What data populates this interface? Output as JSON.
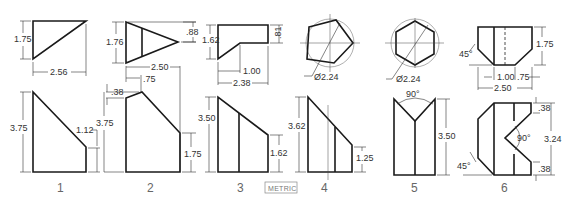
{
  "figure": {
    "badge": "METRIC",
    "problems": [
      {
        "number": "1",
        "top_view": {
          "height": "1.75",
          "width": "2.56"
        },
        "front_view": {
          "height": "3.75",
          "right_height": "1.12"
        }
      },
      {
        "number": "2",
        "top_view": {
          "height": "1.76",
          "tip_offset": ".88",
          "width": "2.50",
          "inner_line": ".75"
        },
        "front_view": {
          "left_top": ".38",
          "height": "3.75",
          "right_height": "1.75"
        }
      },
      {
        "number": "3",
        "top_view": {
          "left_dim": ".88",
          "height": "1.62",
          "right_height": ".81",
          "inner_width": "1.00",
          "width": "2.38"
        },
        "front_view": {
          "height": "3.50",
          "right_height": "1.62",
          "left_outer": "1.75"
        }
      },
      {
        "number": "4",
        "top_view": {
          "shape": "pentagon",
          "diameter": "Ø2.24"
        },
        "front_view": {
          "height": "3.62",
          "right_height": "1.25"
        }
      },
      {
        "number": "5",
        "top_view": {
          "shape": "hexagon",
          "diameter": "Ø2.24"
        },
        "front_view": {
          "angle": "90°",
          "height": "3.50"
        }
      },
      {
        "number": "6",
        "top_view": {
          "angle": "45°",
          "height": "1.75",
          "bottom_width": "1.00",
          "right_offset": ".75",
          "width": "2.50"
        },
        "front_view": {
          "top_notch": ".38",
          "angle": "90°",
          "height": "3.24",
          "bottom_notch": ".38",
          "chamfer_angle": "45°"
        }
      }
    ]
  }
}
